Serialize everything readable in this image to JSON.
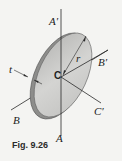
{
  "figure": {
    "caption": "Fig. 9.26",
    "labels": {
      "A_prime": "A′",
      "A": "A",
      "B": "B",
      "B_prime": "B′",
      "C": "C",
      "C_prime": "C′",
      "t": "t",
      "r": "r"
    },
    "colors": {
      "disk_face": "#c9c9c7",
      "disk_edge": "#8d8d8b",
      "lines": "#2a2a2a",
      "background": "#f4f4f2"
    }
  }
}
